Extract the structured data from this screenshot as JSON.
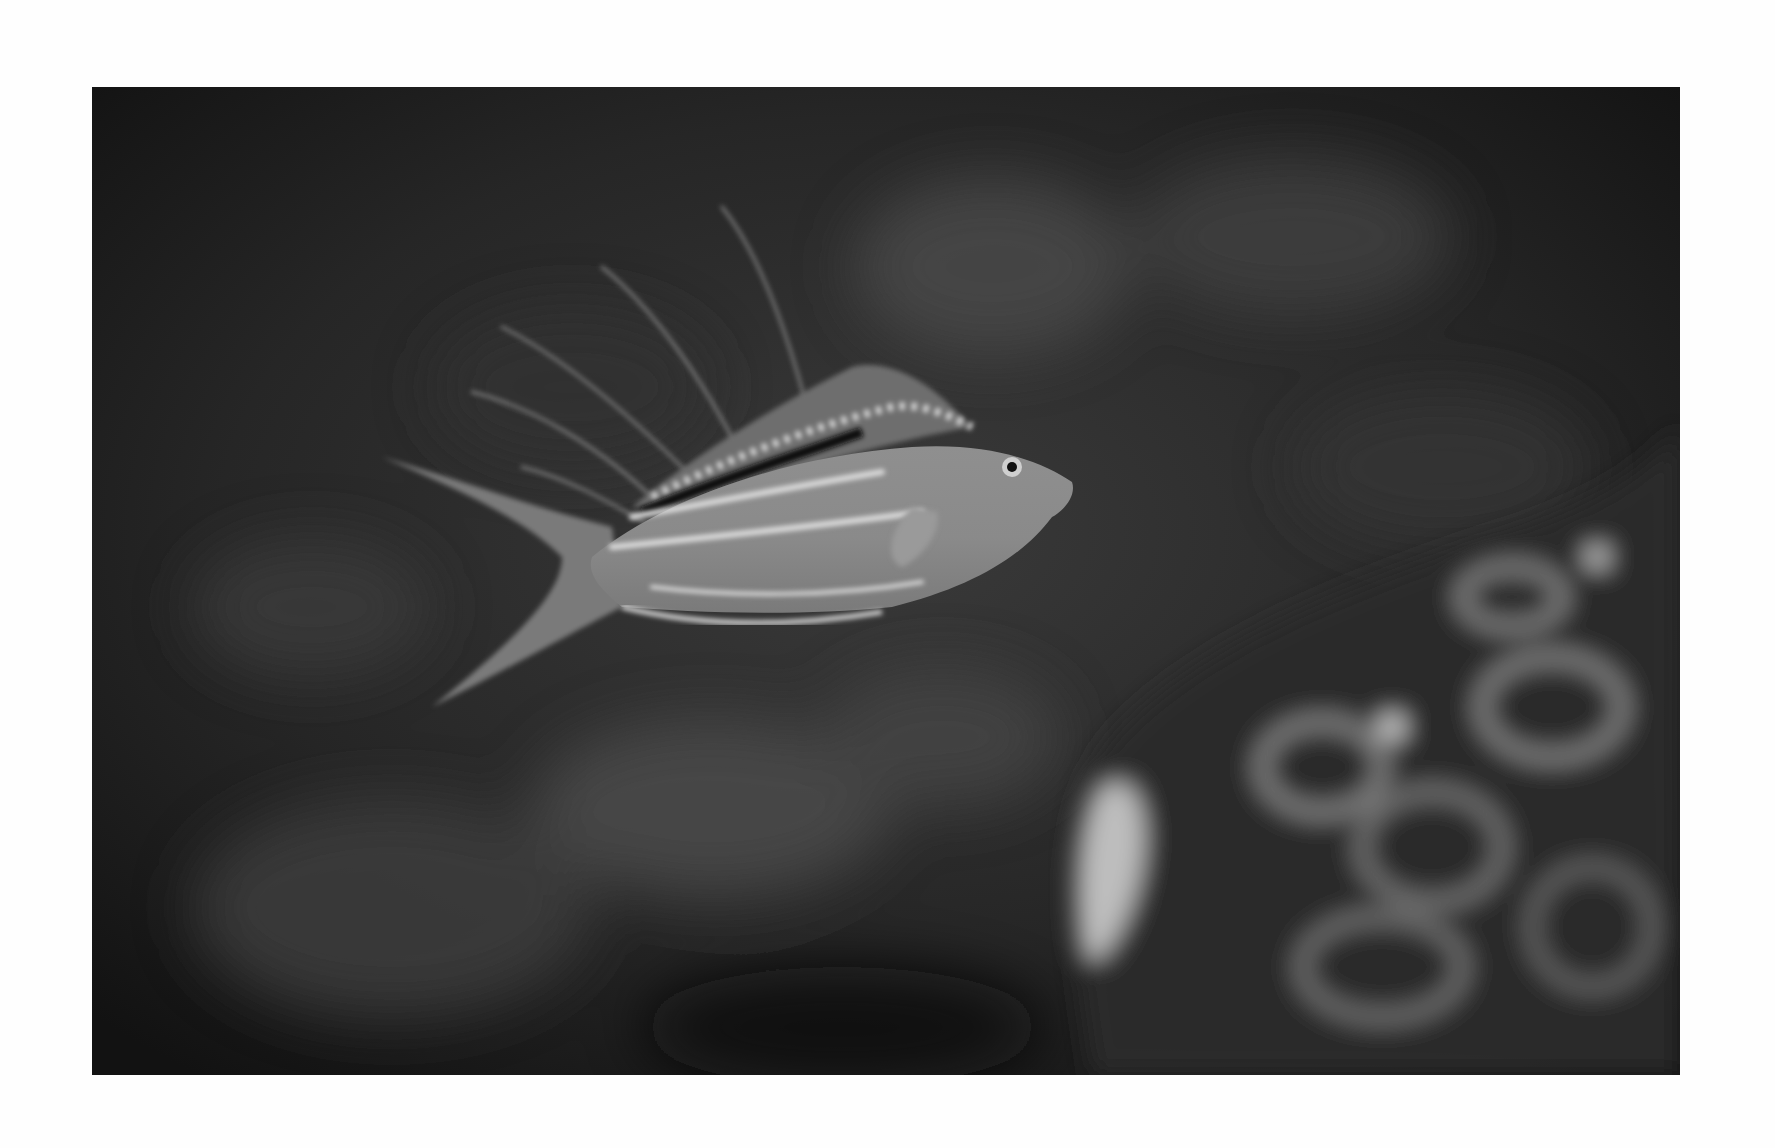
{
  "page": {
    "background": "#fefefe"
  },
  "photo": {
    "subject": "fish",
    "description": "Grayscale photograph of a filamented fairy wrasse swimming to the right above a blurred coral reef",
    "tone": "grayscale",
    "background_color": "#1c1c1c",
    "fish_body_color": "#8a8a8a",
    "stripe_color": "#d8d8d8",
    "reef_highlight_color": "#c9c9c9"
  }
}
